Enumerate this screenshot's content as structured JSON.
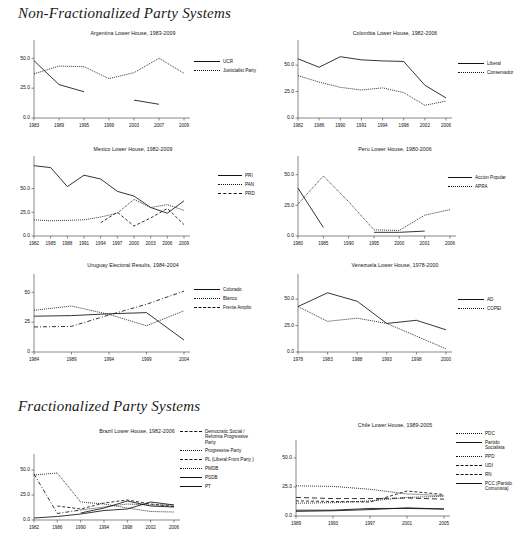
{
  "headings": {
    "non_fractionalized": "Non-Fractionalized Party Systems",
    "fractionalized": "Fractionalized Party Systems"
  },
  "chart_data": [
    {
      "id": "argentina",
      "type": "line",
      "title": "Argentina Lower House, 1983-2009",
      "xlabel": "",
      "ylabel": "",
      "ylim": [
        0,
        62
      ],
      "yticks": [
        0.0,
        25.0,
        50.0
      ],
      "yticklabels": [
        "0.0",
        "25.0",
        "50.0"
      ],
      "grid": false,
      "legend_position": "right",
      "categories": [
        "1983",
        "1989",
        "1995",
        "1999",
        "2003",
        "2007",
        "2009"
      ],
      "series": [
        {
          "name": "UCR",
          "style": "solid",
          "x": [
            "1983",
            "1989",
            "1995"
          ],
          "values": [
            48.0,
            28.0,
            22.0
          ]
        },
        {
          "name": "UCR",
          "style": "solid",
          "x": [
            "2003",
            "2007"
          ],
          "values": [
            15.0,
            11.5
          ]
        },
        {
          "name": "Justicialist Party",
          "style": "dotted",
          "x": [
            "1983",
            "1989",
            "1995",
            "1999",
            "2003",
            "2007",
            "2009"
          ],
          "values": [
            37.0,
            43.5,
            43.0,
            33.0,
            38.0,
            50.0,
            37.5
          ]
        }
      ]
    },
    {
      "id": "colombia",
      "type": "line",
      "title": "Colombia Lower House, 1982-2006",
      "ylim": [
        0,
        70
      ],
      "yticks": [
        0.0,
        25.0,
        50.0
      ],
      "yticklabels": [
        "0.0",
        "25.0",
        "50.0"
      ],
      "grid": false,
      "legend_position": "right",
      "categories": [
        "1982",
        "1986",
        "1990",
        "1991",
        "1994",
        "1998",
        "2002",
        "2006"
      ],
      "series": [
        {
          "name": "Liberal",
          "style": "solid",
          "values": [
            56.0,
            48.0,
            58.0,
            55.0,
            54.0,
            53.5,
            31.0,
            19.0
          ]
        },
        {
          "name": "Conservador",
          "style": "dotted",
          "values": [
            40.0,
            34.0,
            29.0,
            26.5,
            28.5,
            24.0,
            12.0,
            16.0
          ]
        }
      ]
    },
    {
      "id": "mexico",
      "type": "line",
      "title": "Mexico Lower House, 1982-2009",
      "ylim": [
        0,
        80
      ],
      "yticks": [
        0.0,
        25.0,
        50.0
      ],
      "yticklabels": [
        "0.0",
        "25.0",
        "50.0"
      ],
      "grid": false,
      "legend_position": "right",
      "categories": [
        "1982",
        "1985",
        "1988",
        "1991",
        "1994",
        "1997",
        "2000",
        "2003",
        "2006",
        "2009"
      ],
      "series": [
        {
          "name": "PRI",
          "style": "solid",
          "values": [
            74.0,
            72.0,
            52.0,
            64.0,
            60.0,
            47.0,
            42.0,
            30.0,
            24.0,
            37.0
          ]
        },
        {
          "name": "PAN",
          "style": "dotted",
          "values": [
            17.0,
            16.0,
            16.5,
            17.0,
            20.0,
            24.0,
            38.5,
            30.0,
            33.0,
            27.0
          ]
        },
        {
          "name": "PRD",
          "style": "dashed",
          "x": [
            "1994",
            "1997",
            "2000",
            "2003",
            "2006",
            "2009"
          ],
          "values": [
            14.0,
            25.0,
            10.5,
            19.0,
            29.0,
            12.0
          ]
        }
      ]
    },
    {
      "id": "peru",
      "type": "line",
      "title": "Peru Lower House, 1980-2006",
      "ylim": [
        0,
        62
      ],
      "yticks": [
        0.0,
        25.0,
        50.0
      ],
      "yticklabels": [
        "0.0",
        "25.0",
        "50.0"
      ],
      "grid": false,
      "legend_position": "right",
      "categories": [
        "1980",
        "1985",
        "1990",
        "1995",
        "2000",
        "2001",
        "2006"
      ],
      "series": [
        {
          "name": "Accion Popular",
          "style": "solid",
          "x": [
            "1980",
            "1985"
          ],
          "values": [
            39.0,
            7.0
          ]
        },
        {
          "name": "Accion Popular",
          "style": "solid",
          "x": [
            "1995",
            "2000",
            "2001"
          ],
          "values": [
            3.0,
            3.0,
            4.0
          ]
        },
        {
          "name": "APRA",
          "style": "dotted",
          "values": [
            26.0,
            49.0,
            28.0,
            5.0,
            4.5,
            17.0,
            21.5
          ]
        }
      ]
    },
    {
      "id": "uruguay",
      "type": "line",
      "title": "Uruguay Electoral Results, 1984-2004",
      "ylim": [
        0,
        62
      ],
      "yticks": [
        0,
        25,
        50
      ],
      "yticklabels": [
        "0",
        "25",
        "50"
      ],
      "grid": false,
      "legend_position": "right",
      "categories": [
        "1984",
        "1989",
        "1994",
        "1999",
        "2004"
      ],
      "series": [
        {
          "name": "Colorado",
          "style": "solid",
          "values": [
            30.0,
            30.5,
            32.0,
            33.0,
            10.0
          ]
        },
        {
          "name": "Blanco",
          "style": "dotted",
          "values": [
            35.0,
            38.5,
            31.5,
            22.0,
            34.5
          ]
        },
        {
          "name": "Frente Amplio",
          "style": "dashdot",
          "values": [
            21.0,
            21.5,
            31.0,
            40.0,
            51.0
          ]
        }
      ]
    },
    {
      "id": "venezuela",
      "type": "line",
      "title": "Venezuela Lower House, 1978-2000",
      "ylim": [
        0,
        70
      ],
      "yticks": [
        0.0,
        25.0,
        50.0
      ],
      "yticklabels": [
        "0.0",
        "25.0",
        "50.0"
      ],
      "grid": false,
      "legend_position": "right",
      "categories": [
        "1978",
        "1983",
        "1988",
        "1993",
        "1998",
        "2000"
      ],
      "series": [
        {
          "name": "AD",
          "style": "solid",
          "values": [
            43.0,
            56.0,
            48.0,
            27.0,
            30.0,
            21.0
          ]
        },
        {
          "name": "COPEI",
          "style": "dotted",
          "values": [
            43.0,
            29.0,
            32.0,
            27.0,
            15.0,
            3.0
          ]
        }
      ]
    },
    {
      "id": "brazil",
      "type": "line",
      "title": "Brazil Lower House, 1982-2006",
      "ylim": [
        0,
        62
      ],
      "yticks": [
        0.0,
        25.0,
        50.0
      ],
      "yticklabels": [
        "0.0",
        "25.0",
        "50.0"
      ],
      "grid": false,
      "legend_position": "right",
      "categories": [
        "1982",
        "1986",
        "1990",
        "1994",
        "1998",
        "2002",
        "2006"
      ],
      "series": [
        {
          "name": "Democratic Social /\nReforma Progressive\nParty",
          "style": "dashdot",
          "x": [
            "1982",
            "1986",
            "1990"
          ],
          "values": [
            46.0,
            6.5,
            10.0
          ]
        },
        {
          "name": "Progressive Party",
          "style": "dotted",
          "values": [
            45.0,
            47.0,
            18.0,
            16.0,
            12.0,
            8.5,
            8.0
          ]
        },
        {
          "name": "PL (Liberal Front Party )",
          "style": "dashed",
          "x": [
            "1986",
            "1990",
            "1994",
            "1998",
            "2002",
            "2006"
          ],
          "values": [
            14.0,
            11.0,
            17.0,
            20.0,
            16.0,
            13.5
          ]
        },
        {
          "name": "PMDB",
          "style": "dotted",
          "x": [
            "1990",
            "1994",
            "1998",
            "2002",
            "2006"
          ],
          "values": [
            10.0,
            13.0,
            16.0,
            15.0,
            15.0
          ]
        },
        {
          "name": "PSDB",
          "style": "solid",
          "x": [
            "1990",
            "1994",
            "1998",
            "2002",
            "2006"
          ],
          "values": [
            7.0,
            12.0,
            19.0,
            14.0,
            13.0
          ]
        },
        {
          "name": "PT",
          "style": "solid-thick",
          "values": [
            2.0,
            3.5,
            6.0,
            9.5,
            11.0,
            18.0,
            15.0
          ]
        }
      ]
    },
    {
      "id": "chile",
      "type": "line",
      "title": "Chile Lower House, 1989-2005",
      "ylim": [
        0,
        62
      ],
      "yticks": [
        0.0,
        25.0,
        50.0
      ],
      "yticklabels": [
        "0.0",
        "25.0",
        "50.0"
      ],
      "grid": false,
      "legend_position": "right",
      "categories": [
        "1989",
        "1993",
        "1997",
        "2001",
        "2005"
      ],
      "series": [
        {
          "name": "PDC",
          "style": "dotted",
          "values": [
            26.0,
            25.5,
            23.0,
            19.0,
            17.5
          ]
        },
        {
          "name": "Partido Socialista",
          "style": "solid",
          "values": [
            4.0,
            4.5,
            5.5,
            7.0,
            6.0
          ]
        },
        {
          "name": "PPD",
          "style": "dotted",
          "values": [
            11.0,
            11.5,
            13.0,
            16.0,
            17.0
          ]
        },
        {
          "name": "UDI",
          "style": "dashed",
          "values": [
            13.0,
            12.5,
            12.0,
            21.5,
            18.5
          ]
        },
        {
          "name": "RN",
          "style": "dashed-long",
          "values": [
            16.0,
            15.0,
            15.0,
            15.5,
            14.5
          ]
        },
        {
          "name": "PCC (Partido\nComunista)",
          "style": "solid",
          "values": [
            5.0,
            5.0,
            6.5,
            6.5,
            6.0
          ]
        }
      ]
    }
  ]
}
